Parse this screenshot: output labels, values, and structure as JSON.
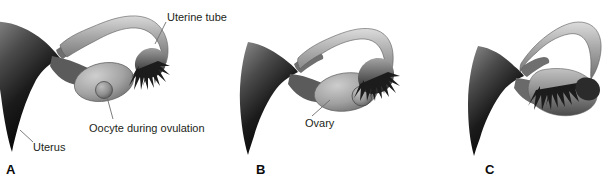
{
  "figure": {
    "background_color": "#ffffff",
    "text_color": "#231f20",
    "line_color": "#6d6d6d"
  },
  "panels": [
    {
      "letter": "A",
      "caption_state": "Oocyte released from ovary during ovulation",
      "labels": [
        {
          "id": "uterine-tube",
          "text": "Uterine tube"
        },
        {
          "id": "oocyte",
          "text": "Oocyte during ovulation"
        },
        {
          "id": "uterus",
          "text": "Uterus"
        }
      ]
    },
    {
      "letter": "B",
      "caption_state": "Fimbriae sweeping over the ovary",
      "labels": [
        {
          "id": "ovary",
          "text": "Ovary"
        }
      ]
    },
    {
      "letter": "C",
      "caption_state": "Fimbriae enveloping the ovary",
      "labels": []
    }
  ],
  "anatomy": {
    "uterus": "uterus-shape",
    "uterine_tube": "uterine-tube-shape",
    "fimbriae": "fimbriae-shape",
    "ovary": "ovary-shape",
    "oocyte": "oocyte-shape"
  }
}
